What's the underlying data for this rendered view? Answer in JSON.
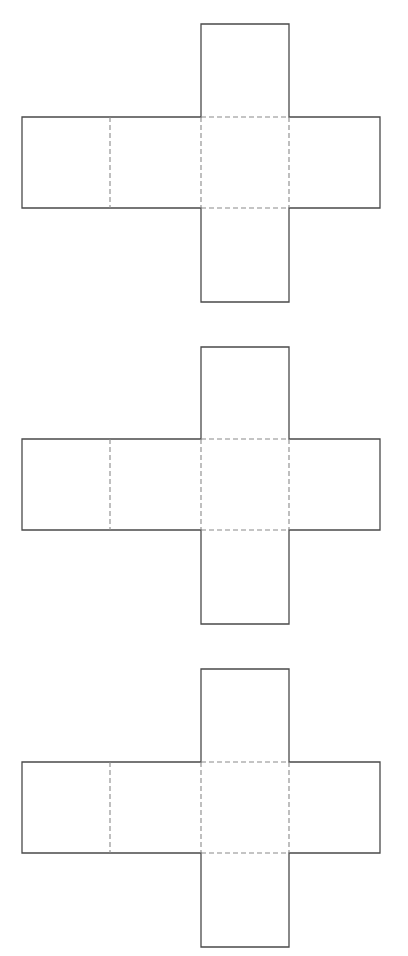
{
  "diagram": {
    "type": "cube-nets",
    "count": 3,
    "colors": {
      "solid_line": "#4a4a4a",
      "fold_line": "#8a8a8a",
      "background": "#ffffff"
    },
    "nets": [
      {
        "id": "net-1",
        "top": 24,
        "row_top": 117,
        "row_bottom": 208,
        "bottom": 302
      },
      {
        "id": "net-2",
        "top": 347,
        "row_top": 439,
        "row_bottom": 530,
        "bottom": 624
      },
      {
        "id": "net-3",
        "top": 669,
        "row_top": 762,
        "row_bottom": 853,
        "bottom": 947
      }
    ],
    "columns": {
      "left": 22,
      "c1": 110,
      "c2": 201,
      "c3": 289,
      "right": 380
    }
  }
}
